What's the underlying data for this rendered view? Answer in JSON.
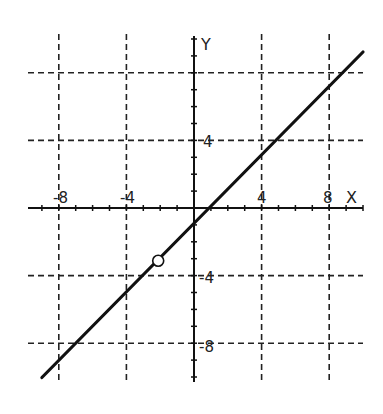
{
  "chart_data": {
    "type": "line",
    "title": "",
    "xlabel": "X",
    "ylabel": "Y",
    "xlim": [
      -10,
      10
    ],
    "ylim": [
      -10,
      10
    ],
    "grid": {
      "on": true,
      "style": "dashed",
      "every": 4
    },
    "x_ticks_labeled": [
      -8,
      -4,
      4,
      8
    ],
    "y_ticks_labeled": [
      4,
      -4,
      -8
    ],
    "minor_tick_step": 1,
    "series": [
      {
        "name": "y = x - 1",
        "equation": "y = x - 1",
        "slope": 1,
        "intercept": -1,
        "x": [
          -9,
          10
        ],
        "y": [
          -10,
          9
        ],
        "open_circle": {
          "x": -2,
          "y": -3
        }
      }
    ],
    "legend": null
  },
  "labels": {
    "x_axis": "X",
    "y_axis": "Y",
    "xt": [
      "-8",
      "-4",
      "4",
      "8"
    ],
    "yt": [
      "4",
      "-4",
      "-8"
    ]
  },
  "colors": {
    "ink": "#111111",
    "grid": "#222222",
    "background": "#ffffff"
  }
}
